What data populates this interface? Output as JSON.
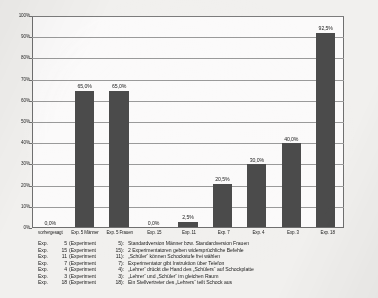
{
  "chart_data": {
    "type": "bar",
    "title": "",
    "subtitle": "",
    "xlabel": "",
    "ylabel": "",
    "ylim": [
      0,
      100
    ],
    "ytick_step": 10,
    "grid": true,
    "legend_position": "below-axis",
    "value_label_suffix": "%",
    "categories": [
      "vorhergesagt",
      "Exp. 5 Männer",
      "Exp. 5 Frauen",
      "Exp. 15",
      "Exp. 11",
      "Exp. 7",
      "Exp. 4",
      "Exp. 3",
      "Exp. 18"
    ],
    "values": [
      0.0,
      65.0,
      65.0,
      0.0,
      2.5,
      20.5,
      30.0,
      40.0,
      92.5
    ],
    "value_labels": [
      "0,0%",
      "65,0%",
      "65,0%",
      "0,0%",
      "2,5%",
      "20,5%",
      "30,0%",
      "40,0%",
      "92,5%"
    ],
    "ytick_labels": [
      "100%",
      "90%",
      "80%",
      "70%",
      "60%",
      "50%",
      "40%",
      "30%",
      "20%",
      "10%",
      "0%"
    ],
    "ytick_values": [
      100,
      90,
      80,
      70,
      60,
      50,
      40,
      30,
      20,
      10,
      0
    ],
    "bar_color": "#4b4b4b",
    "plot_background": "#fbfafa",
    "gridline_color": "#9a9a9a",
    "axis_color": "#6f6f6f"
  },
  "legend": {
    "rows": [
      {
        "short": "Exp.",
        "num": "5",
        "full": "(Experiment",
        "fullnum": "5):",
        "desc": "Standardversion Männer bzw. Standardversion Frauen"
      },
      {
        "short": "Exp.",
        "num": "15",
        "full": "(Experiment",
        "fullnum": "15):",
        "desc": "2 Experimentatoren geben widersprüchliche Befehle"
      },
      {
        "short": "Exp.",
        "num": "11",
        "full": "(Experiment",
        "fullnum": "11):",
        "desc": "„Schüler“ können Schockstufe frei wählen"
      },
      {
        "short": "Exp.",
        "num": "7",
        "full": "(Experiment",
        "fullnum": "7):",
        "desc": "Experimentator gibt Instruktion über Telefon"
      },
      {
        "short": "Exp.",
        "num": "4",
        "full": "(Experiment",
        "fullnum": "4):",
        "desc": "„Lehrer“ drückt die Hand des „Schülers“ auf Schockplatte"
      },
      {
        "short": "Exp.",
        "num": "3",
        "full": "(Experiment",
        "fullnum": "3):",
        "desc": "„Lehrer“ und „Schüler“ im gleichen Raum"
      },
      {
        "short": "Exp.",
        "num": "18",
        "full": "(Experiment",
        "fullnum": "18):",
        "desc": "Ein Stellvertreter des „Lehrers“ teilt Schock aus"
      }
    ]
  }
}
